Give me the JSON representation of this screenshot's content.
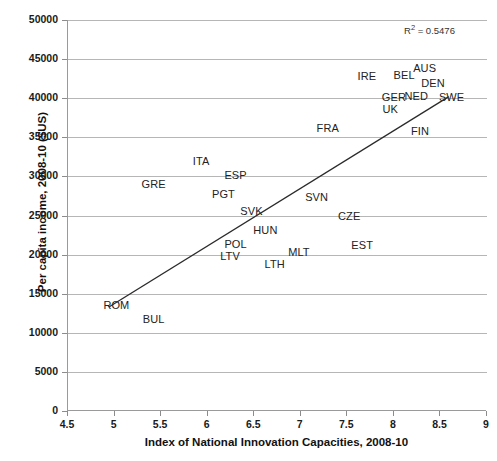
{
  "chart_data": {
    "type": "scatter",
    "title": "",
    "xlabel": "Index of National Innovation Capacities, 2008-10",
    "ylabel": "Per capita income, 2008-10 ($US)",
    "xlim": [
      4.5,
      9
    ],
    "ylim": [
      0,
      50000
    ],
    "xticks": [
      "4.5",
      "5",
      "5.5",
      "6",
      "6.5",
      "7",
      "7.5",
      "8",
      "8.5",
      "9"
    ],
    "xtick_values": [
      4.5,
      5,
      5.5,
      6,
      6.5,
      7,
      7.5,
      8,
      8.5,
      9
    ],
    "yticks": [
      "0",
      "5000",
      "10000",
      "15000",
      "20000",
      "25000",
      "30000",
      "35000",
      "40000",
      "45000",
      "50000"
    ],
    "ytick_values": [
      0,
      5000,
      10000,
      15000,
      20000,
      25000,
      30000,
      35000,
      40000,
      45000,
      50000
    ],
    "grid": true,
    "grid_axis": "y",
    "legend": false,
    "annotation": "R² = 0.5476",
    "r_squared": 0.5476,
    "point_label_style": "text-only",
    "trendline": {
      "type": "linear",
      "x_start": 4.95,
      "y_start": 13300,
      "x_end": 8.6,
      "y_end": 40200
    },
    "points": [
      {
        "label": "GRE",
        "x": 5.42,
        "y": 29000
      },
      {
        "label": "ITA",
        "x": 5.93,
        "y": 32000
      },
      {
        "label": "ESP",
        "x": 6.3,
        "y": 30200
      },
      {
        "label": "PGT",
        "x": 6.17,
        "y": 27700
      },
      {
        "label": "SVK",
        "x": 6.47,
        "y": 25600
      },
      {
        "label": "HUN",
        "x": 6.62,
        "y": 23100
      },
      {
        "label": "POL",
        "x": 6.3,
        "y": 21400
      },
      {
        "label": "LTV",
        "x": 6.24,
        "y": 19800
      },
      {
        "label": "LTH",
        "x": 6.72,
        "y": 18800
      },
      {
        "label": "MLT",
        "x": 6.98,
        "y": 20300
      },
      {
        "label": "SVN",
        "x": 7.17,
        "y": 27400
      },
      {
        "label": "CZE",
        "x": 7.52,
        "y": 25000
      },
      {
        "label": "EST",
        "x": 7.66,
        "y": 21200
      },
      {
        "label": "ROM",
        "x": 5.02,
        "y": 13600
      },
      {
        "label": "BUL",
        "x": 5.42,
        "y": 11800
      },
      {
        "label": "FRA",
        "x": 7.29,
        "y": 36200
      },
      {
        "label": "FIN",
        "x": 8.28,
        "y": 35800
      },
      {
        "label": "IRE",
        "x": 7.71,
        "y": 42900
      },
      {
        "label": "BEL",
        "x": 8.11,
        "y": 43000
      },
      {
        "label": "AUS",
        "x": 8.33,
        "y": 43800
      },
      {
        "label": "DEN",
        "x": 8.42,
        "y": 42000
      },
      {
        "label": "GER",
        "x": 8.0,
        "y": 40100
      },
      {
        "label": "NED",
        "x": 8.24,
        "y": 40300
      },
      {
        "label": "SWE",
        "x": 8.62,
        "y": 40200
      },
      {
        "label": "UK",
        "x": 7.96,
        "y": 38600
      }
    ]
  }
}
